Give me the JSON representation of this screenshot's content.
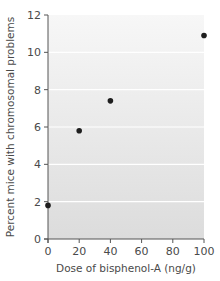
{
  "chart_data": {
    "type": "scatter",
    "title": "",
    "xlabel": "Dose of bisphenol-A (ng/g)",
    "ylabel": "Percent mice with chromosomal problems",
    "x": [
      0,
      20,
      40,
      100
    ],
    "series": [
      {
        "name": "Percent mice with chromosomal problems",
        "values": [
          1.8,
          5.8,
          7.4,
          10.9
        ]
      }
    ],
    "xlim": [
      0,
      100
    ],
    "ylim": [
      0,
      12
    ],
    "xticks": [
      0,
      20,
      40,
      60,
      80,
      100
    ],
    "yticks": [
      0,
      2,
      4,
      6,
      8,
      10,
      12
    ],
    "xtick_labels": [
      "0",
      "20",
      "40",
      "60",
      "80",
      "100"
    ],
    "ytick_labels": [
      "0",
      "2",
      "4",
      "6",
      "8",
      "10",
      "12"
    ],
    "grid": "horizontal",
    "legend": "none"
  },
  "colors": {
    "plot_background_top": "#f7f7f7",
    "plot_background_bottom": "#dcdcdc",
    "gridline": "#ffffff",
    "axis": "#555555",
    "marker": "#1e1e1e"
  },
  "layout": {
    "plot_left": 48,
    "plot_right": 204,
    "plot_top": 15,
    "plot_bottom": 239
  }
}
